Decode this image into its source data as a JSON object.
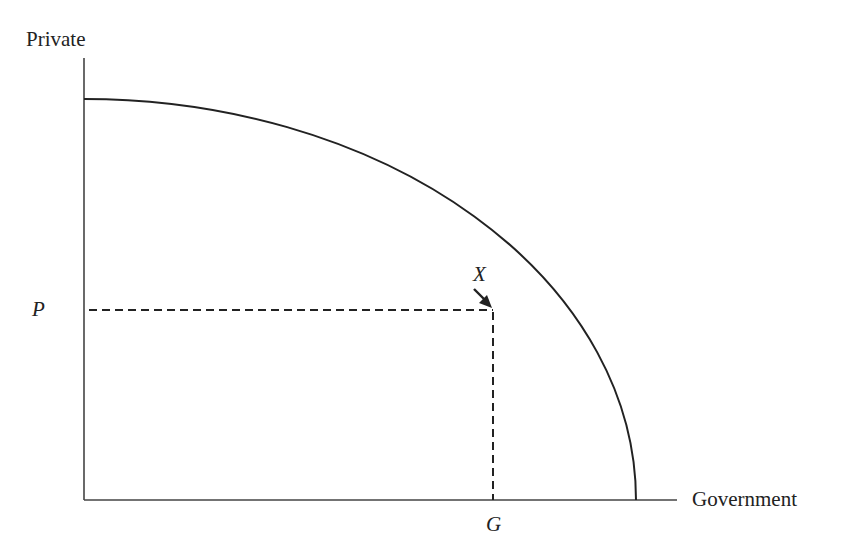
{
  "diagram": {
    "type": "production-possibility-frontier",
    "y_axis_label": "Private",
    "x_axis_label": "Government",
    "point_label": "X",
    "x_tick_label": "G",
    "y_tick_label": "P",
    "colors": {
      "line": "#222222",
      "background": "#ffffff"
    }
  }
}
